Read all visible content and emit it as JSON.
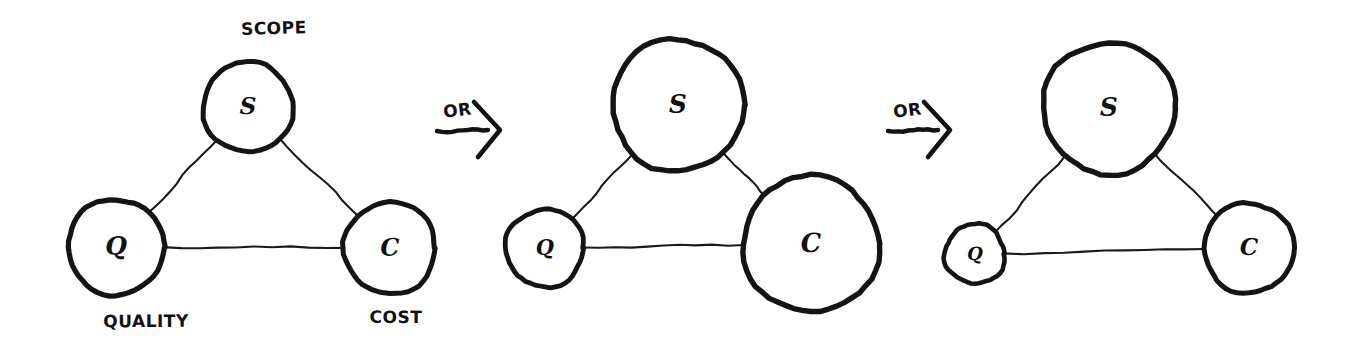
{
  "diagram": {
    "style": {
      "background_color": "#ffffff",
      "ink_color": "#111111",
      "node_fill": "#ffffff"
    },
    "node_names": {
      "S": "Scope",
      "Q": "Quality",
      "C": "Cost"
    },
    "connectors": [
      {
        "name": "or-connector-1",
        "label": "OR"
      },
      {
        "name": "or-connector-2",
        "label": "OR"
      }
    ],
    "panels": [
      {
        "id": "panel-1",
        "name": "balanced-triangle",
        "caption_top": "SCOPE",
        "caption_bottom_left": "QUALITY",
        "caption_bottom_right": "COST",
        "nodes": [
          {
            "key": "S",
            "letter": "S",
            "cx": 248,
            "cy": 107,
            "r": 45,
            "stroke": 5.0,
            "font_size": 23
          },
          {
            "key": "Q",
            "letter": "Q",
            "cx": 116,
            "cy": 247,
            "r": 48,
            "stroke": 5.2,
            "font_size": 25
          },
          {
            "key": "C",
            "letter": "C",
            "cx": 390,
            "cy": 248,
            "r": 46,
            "stroke": 5.0,
            "font_size": 24
          }
        ],
        "labels": {
          "scope": {
            "text": "SCOPE",
            "x": 274,
            "y": 34,
            "size": 17
          },
          "quality": {
            "text": "QUALITY",
            "x": 146,
            "y": 327,
            "size": 17
          },
          "cost": {
            "text": "COST",
            "x": 396,
            "y": 323,
            "size": 17
          }
        }
      },
      {
        "id": "panel-2",
        "name": "scope-and-cost-grown",
        "nodes": [
          {
            "key": "S",
            "letter": "S",
            "cx": 678,
            "cy": 105,
            "r": 66,
            "stroke": 5.4,
            "font_size": 25
          },
          {
            "key": "Q",
            "letter": "Q",
            "cx": 545,
            "cy": 248,
            "r": 39,
            "stroke": 4.8,
            "font_size": 21
          },
          {
            "key": "C",
            "letter": "C",
            "cx": 811,
            "cy": 244,
            "r": 68,
            "stroke": 5.4,
            "font_size": 26
          }
        ]
      },
      {
        "id": "panel-3",
        "name": "quality-shrunk",
        "nodes": [
          {
            "key": "S",
            "letter": "S",
            "cx": 1109,
            "cy": 108,
            "r": 66,
            "stroke": 5.4,
            "font_size": 25
          },
          {
            "key": "Q",
            "letter": "Q",
            "cx": 975,
            "cy": 254,
            "r": 30,
            "stroke": 4.6,
            "font_size": 18
          },
          {
            "key": "C",
            "letter": "C",
            "cx": 1249,
            "cy": 248,
            "r": 45,
            "stroke": 5.0,
            "font_size": 23
          }
        ]
      }
    ],
    "arrows": [
      {
        "name": "or-arrow-1",
        "label": "OR",
        "label_x": 458,
        "label_y": 116,
        "shaft_x1": 437,
        "shaft_x2": 488,
        "shaft_y": 131,
        "tip_x": 500
      },
      {
        "name": "or-arrow-2",
        "label": "OR",
        "label_x": 908,
        "label_y": 116,
        "shaft_x1": 888,
        "shaft_x2": 938,
        "shaft_y": 131,
        "tip_x": 950
      }
    ]
  }
}
